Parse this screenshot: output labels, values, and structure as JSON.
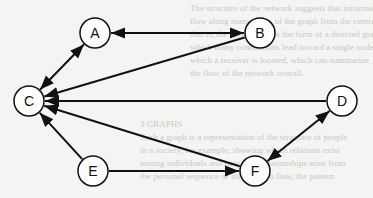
{
  "diagram": {
    "type": "directed-graph",
    "nodes": [
      {
        "id": "A",
        "label": "A",
        "x": 95,
        "y": 33
      },
      {
        "id": "B",
        "label": "B",
        "x": 260,
        "y": 33
      },
      {
        "id": "C",
        "label": "C",
        "x": 29,
        "y": 101
      },
      {
        "id": "D",
        "label": "D",
        "x": 342,
        "y": 101
      },
      {
        "id": "E",
        "label": "E",
        "x": 93,
        "y": 171
      },
      {
        "id": "F",
        "label": "F",
        "x": 255,
        "y": 171
      }
    ],
    "edges": [
      {
        "from": "A",
        "to": "B",
        "bidirectional": true
      },
      {
        "from": "A",
        "to": "C",
        "bidirectional": true
      },
      {
        "from": "B",
        "to": "C",
        "bidirectional": false
      },
      {
        "from": "D",
        "to": "C",
        "bidirectional": false
      },
      {
        "from": "F",
        "to": "C",
        "bidirectional": false
      },
      {
        "from": "E",
        "to": "C",
        "bidirectional": false
      },
      {
        "from": "E",
        "to": "F",
        "bidirectional": false
      },
      {
        "from": "D",
        "to": "F",
        "bidirectional": true
      }
    ],
    "node_radius": 15,
    "colors": {
      "stroke": "#111111",
      "node_fill": "#ffffff",
      "background": "#f4f4f2"
    }
  }
}
